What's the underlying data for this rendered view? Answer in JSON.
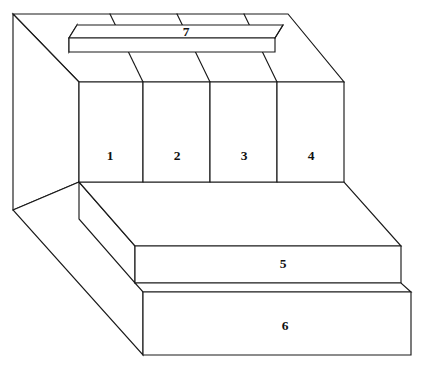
{
  "figure": {
    "type": "isometric-line-drawing",
    "title": "",
    "background_color": "#ffffff",
    "line_color": "#1a1a1a",
    "face_color": "#ffffff",
    "line_width": 1.15,
    "canvas": {
      "width": 422,
      "height": 368
    }
  },
  "labels": {
    "panel_1": "1",
    "panel_2": "2",
    "panel_3": "3",
    "panel_4": "4",
    "slab_5": "5",
    "base_6": "6",
    "bar_7": "7"
  },
  "label_positions": {
    "panel_1": {
      "x": 110,
      "y": 156
    },
    "panel_2": {
      "x": 177,
      "y": 156
    },
    "panel_3": {
      "x": 244,
      "y": 156
    },
    "panel_4": {
      "x": 311,
      "y": 156
    },
    "slab_5": {
      "x": 283,
      "y": 264
    },
    "base_6": {
      "x": 285,
      "y": 326
    },
    "bar_7": {
      "x": 186,
      "y": 36
    }
  },
  "geometry": {
    "body_top_face": "13,14 288,14 344,82 79,82",
    "body_left_face": "13,14 79,82 79,182 13,210",
    "body_left_lower_face": "13,210 79,182 143,292 143,355",
    "panel_front_face": "79,82 344,82 344,182 79,182",
    "panel_dividers": [
      "143,82 143,182",
      "210,82 210,182",
      "277,82 277,182"
    ],
    "panel_top_slant_lines": [
      "110,14 143,82",
      "177,14 210,82",
      "244,14 277,82"
    ],
    "slab5_top_face": "79,182 344,182 401,246 135,246",
    "slab5_front_face": "135,246 401,246 401,283 135,283",
    "slab5_left_face": "79,182 135,246 135,283",
    "base6_top_face": "135,283 401,283 411,292 143,292",
    "base6_front_face": "143,292 411,292 411,355 143,355",
    "bar7_top_face": "77,25 283,25 275,38 69,38",
    "bar7_front_face": "69,38 275,38 275,52 69,52",
    "bar7_left_face": "77,25 69,38 69,52",
    "bar7_right_edge": "275,38 283,25"
  }
}
